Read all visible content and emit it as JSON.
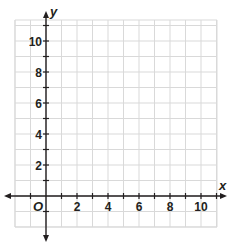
{
  "chart_data": {
    "type": "scatter",
    "title": "",
    "xlabel": "x",
    "ylabel": "y",
    "origin_label": "O",
    "xlim": [
      -2,
      11
    ],
    "ylim": [
      -2,
      11
    ],
    "grid": true,
    "grid_step": 1,
    "x_ticks": [
      2,
      4,
      6,
      8,
      10
    ],
    "x_tick_labels": [
      "2",
      "4",
      "6",
      "8",
      "10"
    ],
    "y_ticks": [
      2,
      4,
      6,
      8,
      10
    ],
    "y_tick_labels": [
      "2",
      "4",
      "6",
      "8",
      "10"
    ],
    "series": [],
    "legend": null
  },
  "colors": {
    "grid": "#d9d9d9",
    "axis": "#231f20",
    "text": "#231f20"
  }
}
